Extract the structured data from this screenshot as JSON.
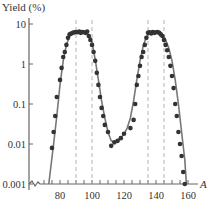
{
  "chart_data": {
    "type": "line",
    "title": "",
    "ylabel": "Yield (%)",
    "xlabel": "A",
    "yscale": "log",
    "ylim": [
      0.001,
      10
    ],
    "xlim": [
      60,
      162
    ],
    "x_ticks": [
      80,
      100,
      120,
      140,
      160
    ],
    "x_tick_labels": [
      "80",
      "100",
      "120",
      "140",
      "160"
    ],
    "y_ticks": [
      10,
      1,
      0.1,
      0.01,
      0.001
    ],
    "y_tick_labels": [
      "10",
      "1",
      "0.1",
      "0.01",
      "0.001"
    ],
    "grid": false,
    "legend": null,
    "vertical_dashed_lines": [
      90,
      100,
      135,
      145
    ],
    "series": [
      {
        "name": "measured yield",
        "style": "points",
        "x": [
          75,
          76,
          77,
          78,
          80,
          81,
          82,
          83,
          84,
          85,
          86,
          87,
          88,
          89,
          90,
          91,
          92,
          93,
          94,
          95,
          96,
          97,
          98,
          99,
          100,
          101,
          102,
          103,
          104,
          105,
          106,
          107,
          108,
          110,
          112,
          114,
          116,
          118,
          120,
          124,
          126,
          127,
          128,
          129,
          130,
          131,
          132,
          133,
          134,
          135,
          136,
          137,
          138,
          139,
          140,
          141,
          142,
          143,
          144,
          145,
          146,
          147,
          148,
          149,
          150,
          151,
          152,
          153,
          154,
          155,
          156,
          157,
          158
        ],
        "y": [
          0.008,
          0.02,
          0.05,
          0.15,
          0.4,
          0.8,
          1.5,
          2.0,
          3.0,
          4.5,
          5.5,
          5.8,
          6.0,
          6.2,
          6.3,
          6.2,
          6.5,
          6.0,
          6.3,
          6.2,
          6.0,
          6.5,
          5.0,
          4.0,
          3.0,
          2.0,
          1.2,
          0.6,
          0.3,
          0.15,
          0.08,
          0.05,
          0.03,
          0.02,
          0.009,
          0.011,
          0.012,
          0.014,
          0.018,
          0.025,
          0.04,
          0.1,
          0.3,
          0.5,
          0.9,
          1.5,
          2.0,
          3.0,
          4.5,
          6.0,
          6.2,
          5.8,
          6.3,
          6.0,
          6.2,
          6.3,
          6.0,
          5.5,
          5.0,
          4.0,
          3.0,
          2.2,
          1.5,
          0.9,
          0.5,
          0.25,
          0.1,
          0.05,
          0.02,
          0.01,
          0.005,
          0.002,
          0.001
        ]
      },
      {
        "name": "fit curve",
        "style": "line",
        "x": [
          73,
          76,
          78,
          80,
          82,
          84,
          86,
          88,
          90,
          92,
          94,
          96,
          98,
          100,
          102,
          104,
          106,
          108,
          110,
          112,
          114,
          116,
          118,
          120,
          122,
          124,
          126,
          128,
          130,
          132,
          134,
          136,
          138,
          140,
          142,
          144,
          146,
          148,
          150,
          152,
          154,
          156,
          158,
          159
        ],
        "y": [
          0.001,
          0.01,
          0.05,
          0.3,
          1.2,
          3.0,
          5.0,
          6.0,
          6.3,
          6.3,
          6.2,
          6.0,
          5.5,
          3.5,
          1.3,
          0.4,
          0.12,
          0.045,
          0.02,
          0.012,
          0.011,
          0.012,
          0.014,
          0.018,
          0.025,
          0.045,
          0.12,
          0.4,
          1.2,
          2.8,
          4.8,
          6.0,
          6.3,
          6.3,
          6.2,
          5.5,
          4.0,
          2.5,
          1.2,
          0.4,
          0.1,
          0.02,
          0.004,
          0.001
        ]
      }
    ]
  }
}
